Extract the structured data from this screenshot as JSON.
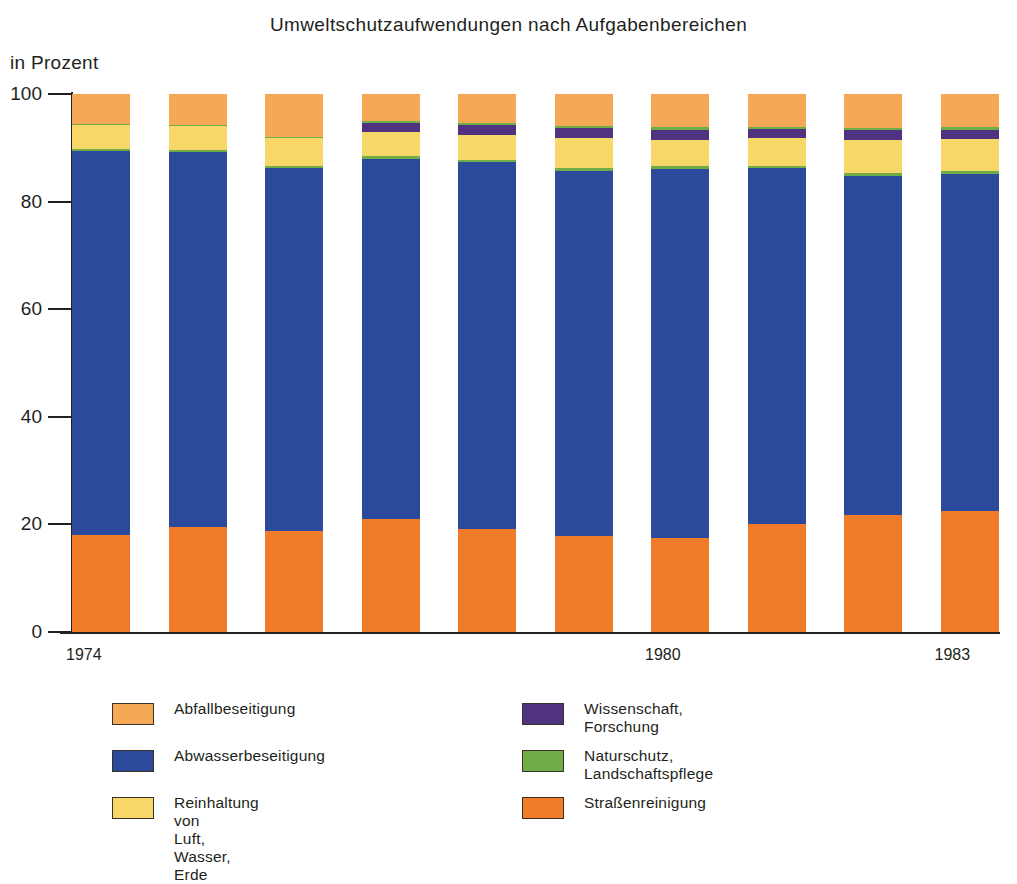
{
  "chart_data": {
    "type": "bar",
    "subtype": "stacked-100-percent",
    "title": "Umweltschutzaufwendungen nach Aufgabenbereichen",
    "ylabel": "in Prozent",
    "xlabel": "",
    "ylim": [
      0,
      100
    ],
    "yticks": [
      0,
      20,
      40,
      60,
      80,
      100
    ],
    "ytick_labels": [
      "0",
      "20",
      "40",
      "60",
      "80",
      "100"
    ],
    "grid": false,
    "legend_position": "below",
    "categories": [
      "1974",
      "1975",
      "1976",
      "1977",
      "1978",
      "1979",
      "1980",
      "1981",
      "1982",
      "1983"
    ],
    "xtick_labels_shown": [
      "1974",
      "1980",
      "1983"
    ],
    "series": [
      {
        "name": "Abwasserbeseitigung",
        "color": "#2B4A9B",
        "values": [
          71.5,
          69.9,
          67.7,
          67.3,
          68.6,
          68.2,
          69.0,
          66.5,
          63.4,
          63.0
        ]
      },
      {
        "name": "Straßenreinigung",
        "color": "#F07C2A",
        "values": [
          18.0,
          19.6,
          18.8,
          21.0,
          19.1,
          17.9,
          17.5,
          20.1,
          21.8,
          22.5
        ]
      },
      {
        "name": "Reinhaltung von\nLuft, Wasser, Erde",
        "color": "#F7D768",
        "values": [
          4.5,
          4.5,
          5.2,
          4.6,
          4.6,
          5.6,
          4.8,
          5.1,
          6.1,
          6.0
        ]
      },
      {
        "name": "Wissenschaft, Forschung",
        "color": "#4F3380",
        "values": [
          0.0,
          0.0,
          0.0,
          1.6,
          1.8,
          1.8,
          2.0,
          1.7,
          1.9,
          1.7
        ]
      },
      {
        "name": "Naturschutz, Landschaftspflege",
        "color": "#6FAE46",
        "values": [
          0.3,
          0.3,
          0.4,
          0.5,
          0.6,
          0.6,
          0.5,
          0.5,
          0.5,
          0.6
        ]
      },
      {
        "name": "Abfallbeseitigung",
        "color": "#F5A855",
        "values": [
          5.7,
          5.7,
          7.9,
          5.0,
          5.3,
          5.9,
          6.2,
          6.1,
          6.3,
          6.2
        ]
      }
    ],
    "stack_order_bottom_to_top": [
      "Straßenreinigung",
      "Abwasserbeseitigung",
      "Naturschutz, Landschaftspflege",
      "Reinhaltung von Luft, Wasser, Erde",
      "Wissenschaft, Forschung",
      "Naturschutz, Landschaftspflege",
      "Abfallbeseitigung"
    ],
    "bars": [
      {
        "category": "1974",
        "segments": [
          {
            "key": "strassenreinigung",
            "value": 18.0
          },
          {
            "key": "abwasser",
            "value": 71.4
          },
          {
            "key": "naturschutz",
            "value": 0.3
          },
          {
            "key": "reinhaltung",
            "value": 4.5
          },
          {
            "key": "wissenschaft",
            "value": 0.0
          },
          {
            "key": "naturschutz2",
            "value": 0.2
          },
          {
            "key": "abfall",
            "value": 5.6
          }
        ]
      },
      {
        "category": "1975",
        "segments": [
          {
            "key": "strassenreinigung",
            "value": 19.6
          },
          {
            "key": "abwasser",
            "value": 69.7
          },
          {
            "key": "naturschutz",
            "value": 0.3
          },
          {
            "key": "reinhaltung",
            "value": 4.5
          },
          {
            "key": "wissenschaft",
            "value": 0.0
          },
          {
            "key": "naturschutz2",
            "value": 0.2
          },
          {
            "key": "abfall",
            "value": 5.7
          }
        ]
      },
      {
        "category": "1976",
        "segments": [
          {
            "key": "strassenreinigung",
            "value": 18.8
          },
          {
            "key": "abwasser",
            "value": 67.4
          },
          {
            "key": "naturschutz",
            "value": 0.4
          },
          {
            "key": "reinhaltung",
            "value": 5.2
          },
          {
            "key": "wissenschaft",
            "value": 0.0
          },
          {
            "key": "naturschutz2",
            "value": 0.3
          },
          {
            "key": "abfall",
            "value": 7.9
          }
        ]
      },
      {
        "category": "1977",
        "segments": [
          {
            "key": "strassenreinigung",
            "value": 21.0
          },
          {
            "key": "abwasser",
            "value": 67.0
          },
          {
            "key": "naturschutz",
            "value": 0.4
          },
          {
            "key": "reinhaltung",
            "value": 4.6
          },
          {
            "key": "wissenschaft",
            "value": 1.6
          },
          {
            "key": "naturschutz2",
            "value": 0.4
          },
          {
            "key": "abfall",
            "value": 5.0
          }
        ]
      },
      {
        "category": "1978",
        "segments": [
          {
            "key": "strassenreinigung",
            "value": 19.1
          },
          {
            "key": "abwasser",
            "value": 68.2
          },
          {
            "key": "naturschutz",
            "value": 0.5
          },
          {
            "key": "reinhaltung",
            "value": 4.6
          },
          {
            "key": "wissenschaft",
            "value": 1.8
          },
          {
            "key": "naturschutz2",
            "value": 0.4
          },
          {
            "key": "abfall",
            "value": 5.4
          }
        ]
      },
      {
        "category": "1979",
        "segments": [
          {
            "key": "strassenreinigung",
            "value": 17.9
          },
          {
            "key": "abwasser",
            "value": 67.8
          },
          {
            "key": "naturschutz",
            "value": 0.5
          },
          {
            "key": "reinhaltung",
            "value": 5.6
          },
          {
            "key": "wissenschaft",
            "value": 1.8
          },
          {
            "key": "naturschutz2",
            "value": 0.4
          },
          {
            "key": "abfall",
            "value": 6.0
          }
        ]
      },
      {
        "category": "1980",
        "segments": [
          {
            "key": "strassenreinigung",
            "value": 17.5
          },
          {
            "key": "abwasser",
            "value": 68.6
          },
          {
            "key": "naturschutz",
            "value": 0.5
          },
          {
            "key": "reinhaltung",
            "value": 4.8
          },
          {
            "key": "wissenschaft",
            "value": 2.0
          },
          {
            "key": "naturschutz2",
            "value": 0.4
          },
          {
            "key": "abfall",
            "value": 6.2
          }
        ]
      },
      {
        "category": "1981",
        "segments": [
          {
            "key": "strassenreinigung",
            "value": 20.1
          },
          {
            "key": "abwasser",
            "value": 66.1
          },
          {
            "key": "naturschutz",
            "value": 0.5
          },
          {
            "key": "reinhaltung",
            "value": 5.1
          },
          {
            "key": "wissenschaft",
            "value": 1.7
          },
          {
            "key": "naturschutz2",
            "value": 0.4
          },
          {
            "key": "abfall",
            "value": 6.1
          }
        ]
      },
      {
        "category": "1982",
        "segments": [
          {
            "key": "strassenreinigung",
            "value": 21.8
          },
          {
            "key": "abwasser",
            "value": 63.0
          },
          {
            "key": "naturschutz",
            "value": 0.5
          },
          {
            "key": "reinhaltung",
            "value": 6.1
          },
          {
            "key": "wissenschaft",
            "value": 1.9
          },
          {
            "key": "naturschutz2",
            "value": 0.4
          },
          {
            "key": "abfall",
            "value": 6.3
          }
        ]
      },
      {
        "category": "1983",
        "segments": [
          {
            "key": "strassenreinigung",
            "value": 22.5
          },
          {
            "key": "abwasser",
            "value": 62.6
          },
          {
            "key": "naturschutz",
            "value": 0.5
          },
          {
            "key": "reinhaltung",
            "value": 6.0
          },
          {
            "key": "wissenschaft",
            "value": 1.7
          },
          {
            "key": "naturschutz2",
            "value": 0.5
          },
          {
            "key": "abfall",
            "value": 6.2
          }
        ]
      }
    ]
  },
  "colors": {
    "abfall": "#F5A855",
    "abwasser": "#2B4A9B",
    "reinhaltung": "#F7D768",
    "wissenschaft": "#4F3380",
    "naturschutz": "#6FAE46",
    "naturschutz2": "#6FAE46",
    "strassenreinigung": "#F07C2A",
    "axis": "#231f20",
    "text": "#231f20"
  },
  "legend": {
    "left_items": [
      {
        "label": "Abfallbeseitigung",
        "color_key": "abfall"
      },
      {
        "label": "Abwasserbeseitigung",
        "color_key": "abwasser"
      },
      {
        "label": "Reinhaltung von\nLuft, Wasser, Erde",
        "color_key": "reinhaltung"
      }
    ],
    "right_items": [
      {
        "label": "Wissenschaft, Forschung",
        "color_key": "wissenschaft"
      },
      {
        "label": "Naturschutz, Landschaftspflege",
        "color_key": "naturschutz"
      },
      {
        "label": "Straßenreinigung",
        "color_key": "strassenreinigung"
      }
    ]
  }
}
